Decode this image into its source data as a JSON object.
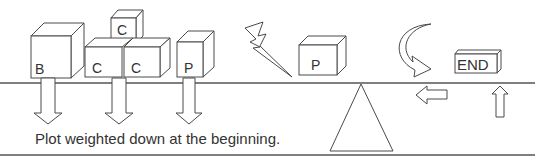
{
  "diagram": {
    "caption": "Plot weighted down at the beginning.",
    "boxes": [
      {
        "label": "B",
        "role": "large-box"
      },
      {
        "label": "C",
        "role": "top-box"
      },
      {
        "label": "C",
        "role": "middle-left-box"
      },
      {
        "label": "C",
        "role": "middle-right-box"
      },
      {
        "label": "P",
        "role": "box-left-of-lightning"
      },
      {
        "label": "P",
        "role": "box-right-of-lightning"
      }
    ],
    "end_label": "END",
    "icons": [
      "down-arrow-icon",
      "lightning-icon",
      "fulcrum-triangle-icon",
      "curved-arrow-icon",
      "left-arrow-icon",
      "up-arrow-icon"
    ]
  }
}
